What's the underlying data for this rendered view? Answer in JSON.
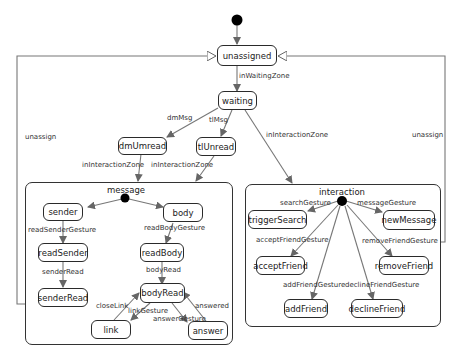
{
  "diagram": {
    "type": "uml-state-machine",
    "states": {
      "unassigned": "unassigned",
      "waiting": "waiting",
      "dmUmread": "dmUmread",
      "tlUnread": "tlUnread",
      "sender": "sender",
      "body": "body",
      "readSender": "readSender",
      "readBody": "readBody",
      "senderRead": "senderRead",
      "bodyRead": "bodyRead",
      "link": "link",
      "answer": "answer",
      "triggerSearch": "triggerSearch",
      "newMessage": "newMessage",
      "acceptFriend": "acceptFriend",
      "removeFriend": "removeFriend",
      "addFriend": "addFriend",
      "declineFriend": "declineFriend"
    },
    "composites": {
      "message": "message",
      "interaction": "interaction"
    },
    "transitions": {
      "inWaitingZone": "inWaitingZone",
      "dmMsg": "dmMsg",
      "tlMsg": "tlMsg",
      "inInteractionZone_dm": "inInteractionZone",
      "inInteractionZone_tl": "inInteractionZone",
      "inInteractionZone_waiting": "inInteractionZone",
      "unassign_left": "unassign",
      "unassign_right": "unassign",
      "readSenderGesture": "readSenderGesture",
      "readBodyGesture": "readBodyGesture",
      "senderRead": "senderRead",
      "bodyRead": "bodyRead",
      "closeLink": "closeLink",
      "linkGesture": "linkGesture",
      "answerGesture": "answerGesture",
      "answered": "answered",
      "searchGesture": "searchGesture",
      "messageGesture": "messageGesture",
      "acceptFriendGesture": "acceptFriendGesture",
      "removeFriendGesture": "removeFriendGesture",
      "addFriendGesture": "addFriendGesture",
      "declineFriendGesture": "declineFriendGesture"
    },
    "colors": {
      "line": "#777777",
      "border": "#2a2a2a",
      "initial": "#000000",
      "background": "#ffffff"
    }
  }
}
